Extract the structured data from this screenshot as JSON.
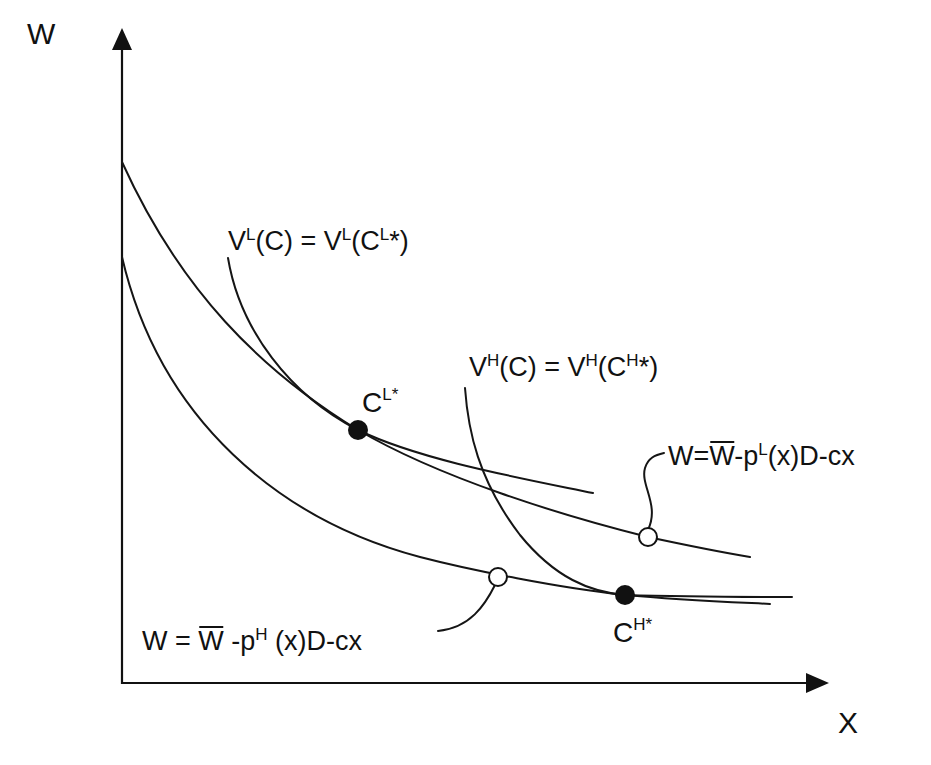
{
  "diagram": {
    "type": "economics-indifference-budget",
    "axes": {
      "y_label": "W",
      "x_label": "X"
    },
    "labels": {
      "vl_equation": {
        "V": "V",
        "sup1": "L",
        "mid": "(C) = V",
        "sup2": "L",
        "open": "(C",
        "sup3": "L",
        "close": "*)"
      },
      "vh_equation": {
        "V": "V",
        "sup1": "H",
        "mid": "(C) = V",
        "sup2": "H",
        "open": "(C",
        "sup3": "H",
        "close": "*)"
      },
      "cl_star": {
        "base": "C",
        "sup": "L*"
      },
      "ch_star": {
        "base": "C",
        "sup": "H*"
      },
      "budget_low_risk": {
        "lhs": "W=",
        "wbar": "W",
        "p": "-p",
        "sup": "L",
        "rest": "(x)D-cx"
      },
      "budget_high_risk": {
        "lhs": "W = ",
        "wbar": "W",
        "p": " -p",
        "sup": "H",
        "rest": " (x)D-cx"
      }
    },
    "points": [
      {
        "name": "C^L*",
        "style": "filled",
        "x": 358,
        "y": 430
      },
      {
        "name": "C^H*",
        "style": "filled",
        "x": 625,
        "y": 595
      },
      {
        "name": "budget-L-marker",
        "style": "open",
        "x": 648,
        "y": 537
      },
      {
        "name": "budget-H-marker",
        "style": "open",
        "x": 498,
        "y": 577
      }
    ],
    "curves": [
      {
        "name": "budget line p^L (upper)",
        "kind": "budget"
      },
      {
        "name": "budget line p^H (lower)",
        "kind": "budget"
      },
      {
        "name": "V^L indifference curve through C^L*",
        "kind": "indifference"
      },
      {
        "name": "V^H indifference curve through C^H*",
        "kind": "indifference"
      }
    ],
    "colors": {
      "ink": "#111111",
      "background": "#ffffff"
    }
  }
}
